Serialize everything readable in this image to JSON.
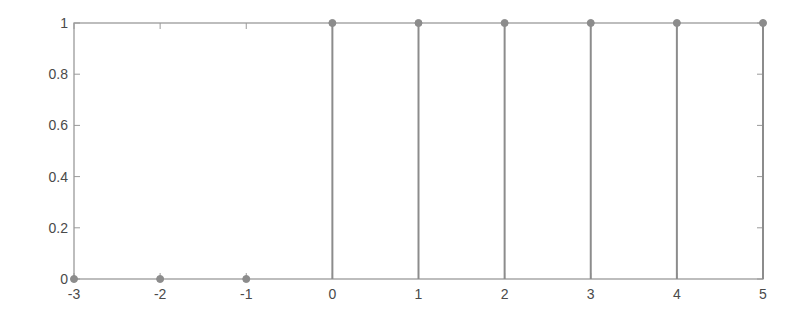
{
  "chart_data": {
    "type": "stem",
    "title": "",
    "xlabel": "",
    "ylabel": "",
    "x": [
      -3,
      -2,
      -1,
      0,
      1,
      2,
      3,
      4,
      5
    ],
    "values": [
      0,
      0,
      0,
      1,
      1,
      1,
      1,
      1,
      1
    ],
    "xlim": [
      -3,
      5
    ],
    "ylim": [
      0,
      1
    ],
    "xticks": [
      "-3",
      "-2",
      "-1",
      "0",
      "1",
      "2",
      "3",
      "4",
      "5"
    ],
    "yticks": [
      "0",
      "0.2",
      "0.4",
      "0.6",
      "0.8",
      "1"
    ],
    "grid": false,
    "legend": null,
    "colors": {
      "stem": "#8c8c8c",
      "marker": "#8c8c8c",
      "axis": "#9a9a9a",
      "text": "#4a4a4a"
    }
  }
}
